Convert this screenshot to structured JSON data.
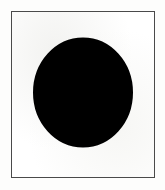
{
  "image": {
    "kind": "scanned-pictogram",
    "width": 165,
    "height": 190,
    "background_color": "#fdfdfc",
    "alt_text": "Black circular prohibition sign with diagonal slash on a white bordered plate"
  },
  "frame": {
    "name": "bordered-plate",
    "fill_color": "#ffffff",
    "border_color": "#4a4a4a",
    "border_width": 1,
    "x": 11,
    "y": 11,
    "width": 144,
    "height": 167
  },
  "symbol": {
    "name": "prohibition-sign",
    "label": "No / Prohibited",
    "color": "#000000",
    "x": 33,
    "y": 37,
    "width": 100,
    "height": 111,
    "ring": {
      "name": "prohibition-ring",
      "center_x": 50,
      "center_y": 55.5,
      "radius_x": 45.5,
      "radius_y": 50.5,
      "stroke_width": 9
    },
    "slash": {
      "name": "prohibition-slash",
      "direction": "upper-left-to-lower-right",
      "thickness": 13,
      "x1": 18,
      "y1": 20,
      "x2": 82,
      "y2": 91
    }
  }
}
